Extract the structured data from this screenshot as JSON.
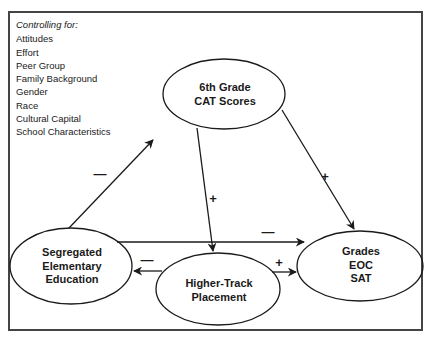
{
  "controls": {
    "heading": "Controlling for:",
    "items": [
      "Attitudes",
      "Effort",
      "Peer Group",
      "Family Background",
      "Gender",
      "Race",
      "Cultural Capital",
      "School Characteristics"
    ]
  },
  "nodes": {
    "cat": {
      "line1": "6th Grade",
      "line2": "CAT Scores"
    },
    "segregated": {
      "line1": "Segregated",
      "line2": "Elementary",
      "line3": "Education"
    },
    "track": {
      "line1": "Higher-Track",
      "line2": "Placement"
    },
    "grades": {
      "line1": "Grades",
      "line2": "EOC",
      "line3": "SAT"
    }
  },
  "edges": {
    "seg_to_cat": "—",
    "cat_to_grades": "+",
    "cat_to_track": "+",
    "seg_to_grades": "—",
    "track_to_seg": "—",
    "track_to_grades": "+"
  },
  "colors": {
    "stroke": "#1a1a1a",
    "frame": "#444444",
    "background": "#ffffff"
  }
}
